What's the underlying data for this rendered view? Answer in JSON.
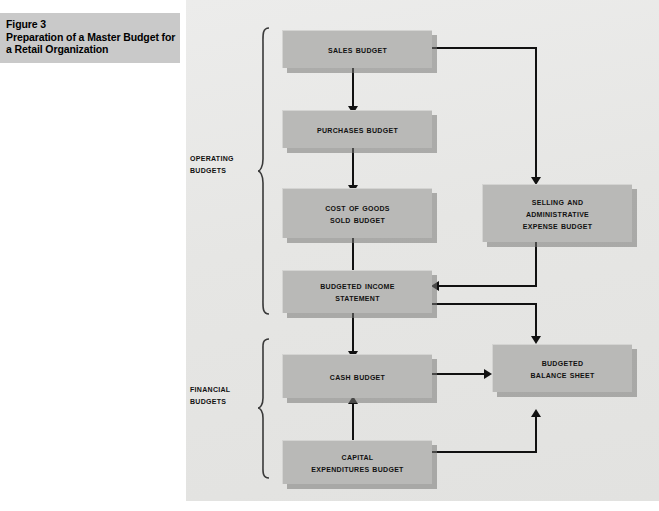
{
  "figure": {
    "caption_lines": [
      "Figure 3",
      "Preparation of a Master Budget for",
      "a Retail Organization"
    ],
    "caption_bg": "#c9c9c9",
    "panel_bg": "#e7e7e5",
    "box_fill": "#b9b9b7",
    "line_color": "#111111"
  },
  "groups": [
    {
      "id": "operating",
      "label_lines": [
        "Operating",
        "Budgets"
      ]
    },
    {
      "id": "financial",
      "label_lines": [
        "Financial",
        "Budgets"
      ]
    }
  ],
  "boxes": [
    {
      "id": "sales-budget",
      "lines": [
        "Sales Budget"
      ]
    },
    {
      "id": "purchases-budget",
      "lines": [
        "Purchases Budget"
      ]
    },
    {
      "id": "cost-of-goods-sold-budget",
      "lines": [
        "Cost of Goods",
        "Sold Budget"
      ]
    },
    {
      "id": "selling-administrative-expense-budget",
      "lines": [
        "Selling and",
        "Administrative",
        "Expense Budget"
      ]
    },
    {
      "id": "budgeted-income-statement",
      "lines": [
        "Budgeted Income",
        "Statement"
      ]
    },
    {
      "id": "cash-budget",
      "lines": [
        "Cash Budget"
      ]
    },
    {
      "id": "capital-expenditures-budget",
      "lines": [
        "Capital",
        "Expenditures Budget"
      ]
    },
    {
      "id": "budgeted-balance-sheet",
      "lines": [
        "Budgeted",
        "Balance Sheet"
      ]
    }
  ],
  "connections": [
    {
      "from": "sales-budget",
      "to": "purchases-budget"
    },
    {
      "from": "sales-budget",
      "to": "selling-administrative-expense-budget"
    },
    {
      "from": "purchases-budget",
      "to": "cost-of-goods-sold-budget"
    },
    {
      "from": "cost-of-goods-sold-budget",
      "to": "budgeted-income-statement"
    },
    {
      "from": "selling-administrative-expense-budget",
      "to": "budgeted-income-statement"
    },
    {
      "from": "budgeted-income-statement",
      "to": "cash-budget"
    },
    {
      "from": "budgeted-income-statement",
      "to": "budgeted-balance-sheet"
    },
    {
      "from": "cash-budget",
      "to": "budgeted-balance-sheet"
    },
    {
      "from": "capital-expenditures-budget",
      "to": "cash-budget"
    },
    {
      "from": "capital-expenditures-budget",
      "to": "budgeted-balance-sheet"
    }
  ]
}
